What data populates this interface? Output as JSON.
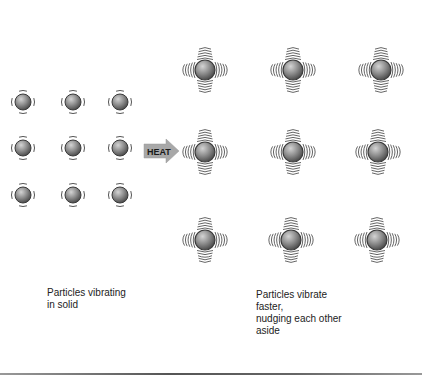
{
  "diagram": {
    "arrow": {
      "label": "HEAT",
      "fill": "#a8a8a8",
      "text_color": "#1a1a1a"
    },
    "solid": {
      "caption": "Particles vibrating\nin solid",
      "particles": [
        {
          "x": 23,
          "y": 102
        },
        {
          "x": 73,
          "y": 102
        },
        {
          "x": 120,
          "y": 102
        },
        {
          "x": 23,
          "y": 148
        },
        {
          "x": 73,
          "y": 148
        },
        {
          "x": 120,
          "y": 148
        },
        {
          "x": 23,
          "y": 195
        },
        {
          "x": 73,
          "y": 195
        },
        {
          "x": 120,
          "y": 195
        }
      ]
    },
    "heated": {
      "caption": "Particles vibrate\nfaster,\nnudging each other\naside",
      "particles": [
        {
          "x": 205,
          "y": 70
        },
        {
          "x": 293,
          "y": 70
        },
        {
          "x": 381,
          "y": 70
        },
        {
          "x": 205,
          "y": 152
        },
        {
          "x": 293,
          "y": 152
        },
        {
          "x": 378,
          "y": 152
        },
        {
          "x": 205,
          "y": 240
        },
        {
          "x": 291,
          "y": 240
        },
        {
          "x": 377,
          "y": 240
        }
      ]
    },
    "colors": {
      "particle_light": "#c8c8c8",
      "particle_dark": "#5a5a5a",
      "outline": "#3a3a3a",
      "wave": "#555555"
    }
  }
}
